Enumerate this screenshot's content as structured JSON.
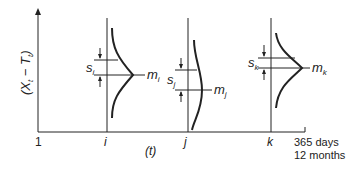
{
  "figure": {
    "y_axis_label_parts": [
      "(X",
      "t",
      " − T",
      "t",
      ")"
    ],
    "x_axis_label": "(t)",
    "x_ticks": {
      "start": "1",
      "i": "i",
      "j": "j",
      "k": "k",
      "end_line1": "365 days",
      "end_line2": "12 months"
    },
    "distributions": [
      {
        "at": "i",
        "mean_label": "m",
        "mean_sub": "i",
        "sd_label": "s",
        "sd_sub": "i"
      },
      {
        "at": "j",
        "mean_label": "m",
        "mean_sub": "j",
        "sd_label": "s",
        "sd_sub": "j"
      },
      {
        "at": "k",
        "mean_label": "m",
        "mean_sub": "k",
        "sd_label": "s",
        "sd_sub": "k"
      }
    ]
  },
  "colors": {
    "ink": "#222222",
    "background": "#ffffff"
  }
}
